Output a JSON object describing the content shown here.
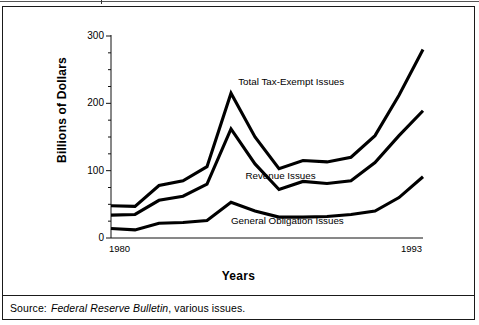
{
  "figure": {
    "source_label": "Source:",
    "source_italic": "Federal Reserve Bulletin",
    "source_rest": ", various issues."
  },
  "chart_data": {
    "type": "line",
    "title": "",
    "xlabel": "Years",
    "ylabel": "Billions of Dollars",
    "xlim": [
      1980,
      1993
    ],
    "ylim": [
      0,
      300
    ],
    "yticks": [
      0,
      100,
      200,
      300
    ],
    "ytick_labels": [
      "0",
      "100",
      "200",
      "300"
    ],
    "y_minor_tick_step": 25,
    "xticks": [
      1980,
      1993
    ],
    "xtick_labels": [
      "1980",
      "1993"
    ],
    "grid": false,
    "legend_position": "inline-annotations",
    "x": [
      1980,
      1981,
      1982,
      1983,
      1984,
      1985,
      1986,
      1987,
      1988,
      1989,
      1990,
      1991,
      1992,
      1993
    ],
    "series": [
      {
        "name": "Total Tax-Exempt Issues",
        "color": "#000000",
        "values": [
          48,
          47,
          78,
          85,
          106,
          215,
          150,
          103,
          115,
          113,
          120,
          152,
          212,
          280
        ]
      },
      {
        "name": "Revenue Issues",
        "color": "#000000",
        "values": [
          34,
          35,
          56,
          62,
          80,
          162,
          110,
          72,
          84,
          81,
          85,
          112,
          152,
          189
        ]
      },
      {
        "name": "General Obligation Issues",
        "color": "#000000",
        "values": [
          14,
          12,
          22,
          23,
          26,
          53,
          40,
          31,
          31,
          32,
          35,
          40,
          60,
          91
        ]
      }
    ],
    "annotations": [
      {
        "text": "Total Tax-Exempt Issues",
        "x": 1985.3,
        "y": 232
      },
      {
        "text": "Revenue Issues",
        "x": 1985.6,
        "y": 92
      },
      {
        "text": "General Obligation Issues",
        "x": 1985.0,
        "y": 25
      }
    ]
  }
}
